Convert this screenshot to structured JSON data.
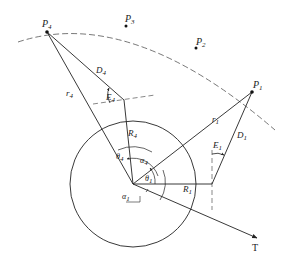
{
  "diagram": {
    "type": "geometric-positioning-diagram",
    "points": [
      {
        "id": "P1",
        "label": "P",
        "sub": "1",
        "x": 252,
        "y": 92
      },
      {
        "id": "P2",
        "label": "P",
        "sub": "2",
        "x": 196,
        "y": 48
      },
      {
        "id": "P3",
        "label": "P",
        "sub": "3",
        "x": 126,
        "y": 26
      },
      {
        "id": "P4",
        "label": "P",
        "sub": "4",
        "x": 47,
        "y": 32
      }
    ],
    "labels": {
      "r4": {
        "main": "r",
        "sub": "4"
      },
      "r1": {
        "main": "r",
        "sub": "1"
      },
      "D4": {
        "main": "D",
        "sub": "4"
      },
      "D1": {
        "main": "D",
        "sub": "1"
      },
      "E4": {
        "main": "E",
        "sub": "4"
      },
      "E1": {
        "main": "E",
        "sub": "1"
      },
      "R4": {
        "main": "R",
        "sub": "4"
      },
      "R1": {
        "main": "R",
        "sub": "1"
      },
      "theta4": {
        "main": "θ",
        "sub": "4"
      },
      "theta1": {
        "main": "θ",
        "sub": "1"
      },
      "alpha4": {
        "main": "α",
        "sub": "4"
      },
      "alpha1": {
        "main": "α",
        "sub": "1"
      },
      "T": {
        "main": "T"
      }
    },
    "colors": {
      "stroke": "#222222",
      "dashed": "#555555",
      "background": "#ffffff"
    }
  }
}
